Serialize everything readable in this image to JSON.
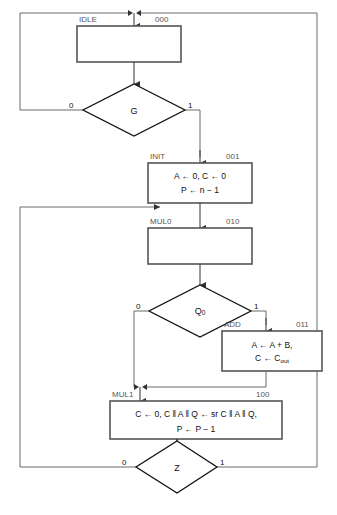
{
  "diagram": {
    "type": "asm-flowchart",
    "width": 337,
    "height": 515,
    "colors": {
      "box_border": "#555555",
      "diamond_border": "#111111",
      "line": "#6b6b6b",
      "text": "#111111",
      "label_text": "#555555",
      "background": "#ffffff"
    },
    "states": [
      {
        "id": "idle",
        "name": "IDLE",
        "code": "000",
        "operations": []
      },
      {
        "id": "init",
        "name": "INIT",
        "code": "001",
        "operations": [
          "A ← 0, C ← 0",
          "P ← n − 1"
        ]
      },
      {
        "id": "mul0",
        "name": "MUL0",
        "code": "010",
        "operations": []
      },
      {
        "id": "add",
        "name": "ADD",
        "code": "011",
        "operations_html": [
          "A ← A + B,",
          "C ← C<sub>out</sub>"
        ]
      },
      {
        "id": "mul1",
        "name": "MUL1",
        "code": "100",
        "operations": [
          "C ← 0, C ‖ A ‖ Q ← sr C ‖ A ‖ Q,",
          "P ← P − 1"
        ]
      }
    ],
    "decisions": [
      {
        "id": "g",
        "label": "G",
        "label_html": "G",
        "false_label": "0",
        "true_label": "1"
      },
      {
        "id": "q0",
        "label": "Q0",
        "label_html": "Q<sub>0</sub>",
        "false_label": "0",
        "true_label": "1"
      },
      {
        "id": "z",
        "label": "Z",
        "label_html": "Z",
        "false_label": "0",
        "true_label": "1"
      }
    ],
    "edges": [
      {
        "from": "idle",
        "to": "g",
        "label": ""
      },
      {
        "from": "g",
        "to": "idle",
        "label": "0"
      },
      {
        "from": "g",
        "to": "init",
        "label": "1"
      },
      {
        "from": "init",
        "to": "mul0",
        "label": ""
      },
      {
        "from": "mul0",
        "to": "q0",
        "label": ""
      },
      {
        "from": "q0",
        "to": "mul1",
        "label": "0"
      },
      {
        "from": "q0",
        "to": "add",
        "label": "1"
      },
      {
        "from": "add",
        "to": "mul1",
        "label": ""
      },
      {
        "from": "mul1",
        "to": "z",
        "label": ""
      },
      {
        "from": "z",
        "to": "mul0",
        "label": "0"
      },
      {
        "from": "z",
        "to": "idle",
        "label": "1"
      }
    ]
  }
}
